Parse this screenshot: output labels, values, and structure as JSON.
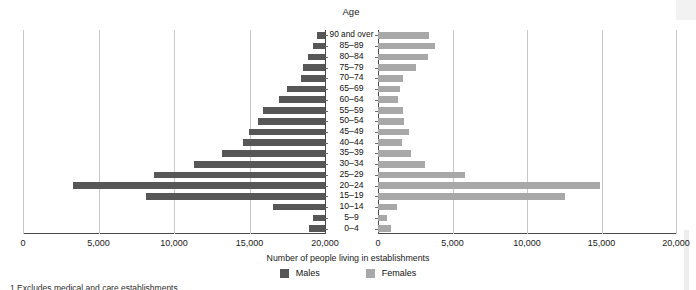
{
  "titles": {
    "age_header": "Age",
    "axis_title": "Number of people living in establishments"
  },
  "legend": {
    "items": [
      {
        "label": "Males",
        "color": "#575757"
      },
      {
        "label": "Females",
        "color": "#a8a8a8"
      }
    ]
  },
  "footnote": "1  Excludes medical and care establishments.",
  "chart_data": {
    "type": "bar",
    "subtype": "population-pyramid",
    "title": "Age",
    "xlabel": "Number of people living in establishments",
    "ylabel": "Age",
    "grid": true,
    "legend_position": "bottom",
    "axis_left_label": "Males",
    "axis_right_label": "Females",
    "xlim_left": [
      20000,
      0
    ],
    "xlim_right": [
      0,
      20000
    ],
    "xticks_left": [
      "20,000",
      "15,000",
      "10,000",
      "5,000",
      "0"
    ],
    "xticks_right": [
      "0",
      "5,000",
      "10,000",
      "15,000",
      "20,000"
    ],
    "xtick_values": [
      0,
      5000,
      10000,
      15000,
      20000
    ],
    "categories": [
      "90 and over",
      "85–89",
      "80–84",
      "75–79",
      "70–74",
      "65–69",
      "60–64",
      "55–59",
      "50–54",
      "45–49",
      "40–44",
      "35–39",
      "30–34",
      "25–29",
      "20–24",
      "15–19",
      "10–14",
      "5–9",
      "0–4"
    ],
    "series": [
      {
        "name": "Males",
        "color": "#575757",
        "side": "left",
        "values": [
          530,
          790,
          1130,
          1450,
          1600,
          2500,
          3050,
          4100,
          4450,
          5050,
          5400,
          6800,
          8700,
          11300,
          16700,
          11850,
          3450,
          800,
          1050
        ]
      },
      {
        "name": "Females",
        "color": "#a8a8a8",
        "side": "right",
        "values": [
          3400,
          3800,
          3350,
          2550,
          1700,
          1500,
          1350,
          1700,
          1750,
          2100,
          1600,
          2200,
          3150,
          5840,
          14900,
          12550,
          1300,
          600,
          900
        ]
      }
    ]
  }
}
